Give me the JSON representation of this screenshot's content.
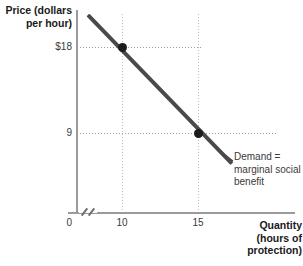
{
  "chart_data": {
    "type": "line",
    "title": "",
    "xlabel": "Quantity (hours of protection)",
    "ylabel": "Price (dollars per hour)",
    "xlim": [
      0,
      20
    ],
    "ylim": [
      0,
      27
    ],
    "grid": false,
    "legend_position": "inline-annotation",
    "axis_break_x": true,
    "x_ticks": [
      "0",
      "10",
      "15"
    ],
    "y_ticks": [
      "0",
      "9",
      "$18"
    ],
    "series": [
      {
        "name": "Demand = marginal social benefit",
        "x": [
          10,
          15
        ],
        "y": [
          18,
          9
        ],
        "marker": "filled-circle"
      }
    ],
    "annotations": [
      {
        "text": "Demand =\nmarginal social\nbenefit",
        "target_x": 16.5,
        "target_y": 6
      }
    ],
    "guide_lines": [
      {
        "orientation": "horizontal",
        "value": 18,
        "style": "dotted"
      },
      {
        "orientation": "horizontal",
        "value": 9,
        "style": "dotted"
      },
      {
        "orientation": "vertical",
        "value": 10,
        "style": "dotted"
      },
      {
        "orientation": "vertical",
        "value": 15,
        "style": "dotted"
      }
    ]
  },
  "axes": {
    "y_title": "Price (dollars\nper hour)",
    "x_title": "Quantity\n(hours of\nprotection)",
    "y_tick_18": "$18",
    "y_tick_9": "9",
    "origin": "0",
    "x_tick_10": "10",
    "x_tick_15": "15"
  },
  "annotation": {
    "demand_label": "Demand =\nmarginal social\nbenefit"
  },
  "colors": {
    "demand_line": "#4a4a4a",
    "point": "#1c1c1c",
    "axis": "#9a9a9a",
    "guide": "#9d9d9d",
    "text": "#3a3a3a",
    "title_text": "#1a1a1a",
    "background": "#ffffff"
  }
}
